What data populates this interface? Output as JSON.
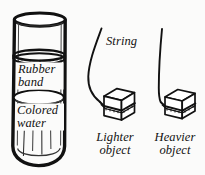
{
  "figure": {
    "name": "archimedes-buoyancy-line-drawing",
    "background_color": "#fbfbfa",
    "ink_color": "#111111"
  },
  "cylinder": {
    "labels": {
      "rubber_band_line1": "Rubber",
      "rubber_band_line2": "band",
      "colored_water_line1": "Colored",
      "colored_water_line2": "water"
    }
  },
  "string_label": "String",
  "objects": [
    {
      "caption_line1": "Lighter",
      "caption_line2": "object",
      "string_state": "slack-curved"
    },
    {
      "caption_line1": "Heavier",
      "caption_line2": "object",
      "string_state": "taut-straight"
    }
  ]
}
